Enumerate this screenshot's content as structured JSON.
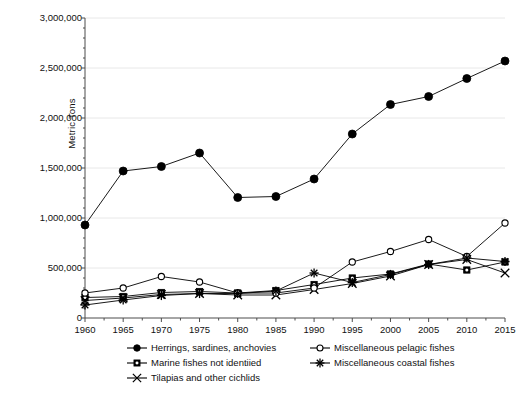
{
  "chart_data": {
    "type": "line",
    "title": "",
    "xlabel": "",
    "ylabel": "Metric Tons",
    "x": [
      1960,
      1965,
      1970,
      1975,
      1980,
      1985,
      1990,
      1995,
      2000,
      2005,
      2010,
      2015
    ],
    "xtick_labels": [
      "1960",
      "1965",
      "1970",
      "1975",
      "1980",
      "1985",
      "1990",
      "1995",
      "2000",
      "2005",
      "2010",
      "2015"
    ],
    "ytick_labels": [
      "0",
      "500,000",
      "1,000,000",
      "1,500,000",
      "2,000,000",
      "2,500,000",
      "3,000,000"
    ],
    "ytick_values": [
      0,
      500000,
      1000000,
      1500000,
      2000000,
      2500000,
      3000000
    ],
    "ylim": [
      0,
      3000000
    ],
    "xlim": [
      1960,
      2015
    ],
    "grid": "horizontal-major",
    "grid_color": "#e8e8e8",
    "axis_color": "#4d4d4d",
    "legend_position": "below-axis",
    "legend_columns": 2,
    "series": [
      {
        "name": "Herrings, sardines, anchovies",
        "marker": "filled-circle",
        "color": "#000000",
        "values": [
          930000,
          1470000,
          1515000,
          1650000,
          1205000,
          1215000,
          1390000,
          1840000,
          2135000,
          2215000,
          2395000,
          2570000
        ]
      },
      {
        "name": "Marine fishes not identiied",
        "marker": "filled-square",
        "color": "#000000",
        "values": [
          205000,
          215000,
          255000,
          265000,
          250000,
          275000,
          335000,
          400000,
          440000,
          540000,
          480000,
          560000
        ]
      },
      {
        "name": "Tilapias and other cichlids",
        "marker": "x-cross",
        "color": "#000000",
        "values": [
          175000,
          200000,
          235000,
          245000,
          230000,
          230000,
          285000,
          345000,
          420000,
          535000,
          585000,
          450000
        ]
      },
      {
        "name": "Miscellaneous pelagic fishes",
        "marker": "open-circle",
        "color": "#000000",
        "values": [
          250000,
          300000,
          415000,
          360000,
          250000,
          250000,
          300000,
          560000,
          665000,
          785000,
          615000,
          950000
        ]
      },
      {
        "name": "Miscellaneous coastal fishes",
        "marker": "plus-star",
        "color": "#000000",
        "values": [
          130000,
          180000,
          225000,
          245000,
          245000,
          270000,
          450000,
          355000,
          435000,
          535000,
          600000,
          565000
        ]
      }
    ]
  }
}
